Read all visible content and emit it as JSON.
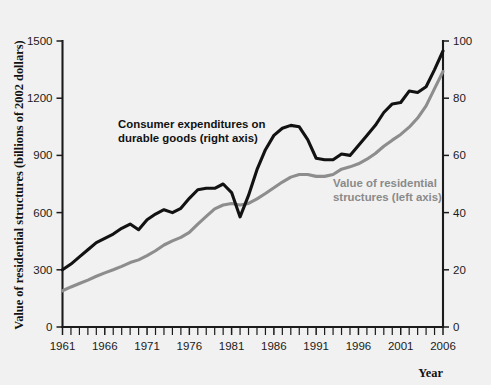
{
  "chart_data": {
    "type": "line",
    "title": "",
    "xlabel": "Year",
    "ylabel_left": "Value of residential structures (billions of 2002 dollars)",
    "ylabel_right": "",
    "xlim": [
      1961,
      2006
    ],
    "ylim_left": [
      0,
      1500
    ],
    "ylim_right": [
      0,
      100
    ],
    "grid": false,
    "legend_position": "inline-annotations",
    "xticks_major": [
      1961,
      1966,
      1971,
      1976,
      1981,
      1986,
      1991,
      1996,
      2001,
      2006
    ],
    "xtick_labels": [
      "1961",
      "1966",
      "1971",
      "1976",
      "1981",
      "1986",
      "1991",
      "1996",
      "2001",
      "2006"
    ],
    "yticks_left": [
      0,
      300,
      600,
      900,
      1200,
      1500
    ],
    "ytick_labels_left": [
      "0",
      "300",
      "600",
      "900",
      "1200",
      "1500"
    ],
    "yticks_right": [
      0,
      20,
      40,
      60,
      80,
      100
    ],
    "ytick_labels_right": [
      "0",
      "20",
      "40",
      "60",
      "80",
      "100"
    ],
    "x": [
      1961,
      1962,
      1963,
      1964,
      1965,
      1966,
      1967,
      1968,
      1969,
      1970,
      1971,
      1972,
      1973,
      1974,
      1975,
      1976,
      1977,
      1978,
      1979,
      1980,
      1981,
      1982,
      1983,
      1984,
      1985,
      1986,
      1987,
      1988,
      1989,
      1990,
      1991,
      1992,
      1993,
      1994,
      1995,
      1996,
      1997,
      1998,
      1999,
      2000,
      2001,
      2002,
      2003,
      2004,
      2005,
      2006
    ],
    "series": [
      {
        "name": "Consumer expenditures on durable goods (right axis)",
        "axis": "right",
        "color": "#121212",
        "annotation": "Consumer expenditures on\ndurable goods (right axis)",
        "values": [
          20.0,
          22.0,
          24.5,
          27.0,
          29.5,
          31.0,
          32.5,
          34.5,
          36.0,
          34.0,
          37.5,
          39.5,
          41.0,
          40.0,
          41.5,
          45.0,
          48.0,
          48.5,
          48.5,
          50.0,
          47.0,
          38.5,
          46.0,
          55.0,
          62.0,
          67.0,
          69.5,
          70.5,
          70.0,
          65.5,
          59.0,
          58.5,
          58.5,
          60.5,
          60.0,
          63.5,
          67.0,
          70.5,
          75.0,
          78.0,
          78.5,
          82.5,
          82.0,
          84.0,
          90.0,
          96.5
        ]
      },
      {
        "name": "Value of residential structures (left axis)",
        "axis": "left",
        "color": "#8d8d8d",
        "annotation": "Value of residential\nstructures (left axis)",
        "values": [
          190,
          210,
          228,
          246,
          266,
          284,
          300,
          318,
          338,
          352,
          374,
          400,
          430,
          452,
          470,
          496,
          540,
          580,
          620,
          640,
          648,
          640,
          648,
          672,
          700,
          730,
          760,
          786,
          800,
          800,
          790,
          790,
          800,
          828,
          840,
          856,
          880,
          910,
          948,
          980,
          1010,
          1048,
          1096,
          1160,
          1250,
          1340
        ]
      }
    ]
  },
  "axes": {
    "ylabel_left_text": "Value of residential structures (billions of 2002 dollars)",
    "xlabel_text": "Year"
  }
}
